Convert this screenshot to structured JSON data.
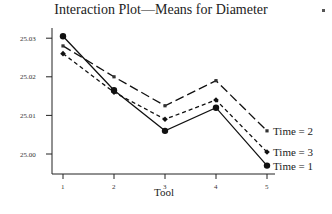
{
  "chart_data": {
    "type": "line",
    "title": "Interaction Plot—Means for Diameter",
    "xlabel": "Tool",
    "ylabel": "",
    "categories": [
      "1",
      "2",
      "3",
      "4",
      "5"
    ],
    "yticks": [
      "25.00",
      "25.01",
      "25.02",
      "25.03"
    ],
    "ylim": [
      24.995,
      25.033
    ],
    "grid": false,
    "legend_position": "inline-right",
    "series": [
      {
        "name": "Time = 1",
        "values": [
          25.0305,
          25.0165,
          25.006,
          25.012,
          24.997
        ],
        "style": "solid",
        "marker": "circle"
      },
      {
        "name": "Time = 2",
        "values": [
          25.028,
          25.02,
          25.0125,
          25.019,
          25.006
        ],
        "style": "long-dash",
        "marker": "square"
      },
      {
        "name": "Time = 3",
        "values": [
          25.026,
          25.016,
          25.009,
          25.014,
          25.0005
        ],
        "style": "short-dash",
        "marker": "diamond"
      }
    ]
  }
}
